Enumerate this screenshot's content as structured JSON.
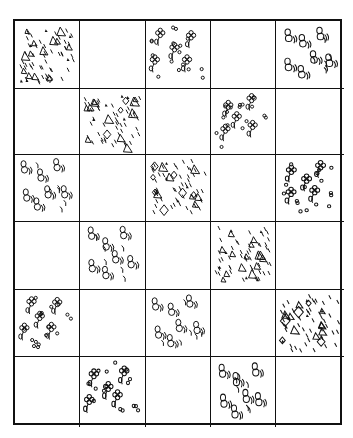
{
  "quilt": {
    "rows": 6,
    "cols": 5,
    "line_color": "#111111",
    "background": "#ffffff",
    "pattern_legend": {
      "triangles": "triangles-and-dashes pattern",
      "flowers": "flowers-and-dots pattern",
      "bees": "bees-with-motion-lines pattern",
      "blank": "empty square"
    },
    "cells": [
      [
        "triangles",
        "blank",
        "flowers",
        "blank",
        "bees"
      ],
      [
        "blank",
        "triangles",
        "blank",
        "flowers",
        "blank"
      ],
      [
        "bees",
        "blank",
        "triangles",
        "blank",
        "flowers"
      ],
      [
        "blank",
        "bees",
        "blank",
        "triangles",
        "blank"
      ],
      [
        "flowers",
        "blank",
        "bees",
        "blank",
        "triangles"
      ],
      [
        "blank",
        "flowers",
        "blank",
        "bees",
        "blank"
      ]
    ]
  }
}
